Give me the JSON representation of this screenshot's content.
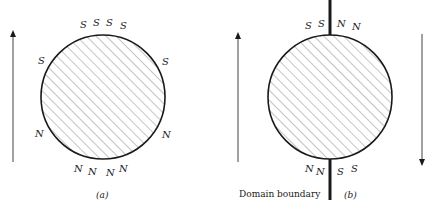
{
  "figure": {
    "panel_a": {
      "caption": "(a)",
      "top_poles": [
        "S",
        "S",
        "S",
        "S"
      ],
      "upper_left_pole": "S",
      "upper_right_pole": "S",
      "lower_left_pole": "N",
      "lower_right_pole": "N",
      "bottom_poles": [
        "N",
        "N",
        "N",
        "N"
      ],
      "magnetization_arrow": "up"
    },
    "panel_b": {
      "caption": "(b)",
      "top_poles": [
        "S",
        "S",
        "N",
        "N"
      ],
      "bottom_poles": [
        "N",
        "N",
        "S",
        "S"
      ],
      "boundary_label": "Domain boundary",
      "left_arrow": "up",
      "right_arrow": "down"
    },
    "colors": {
      "ink": "#1a1a1a",
      "hatch": "#555555",
      "background": "#ffffff"
    }
  }
}
